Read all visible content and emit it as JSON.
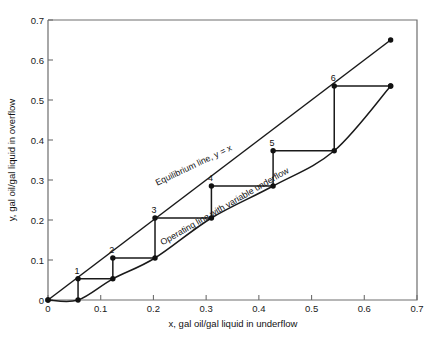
{
  "chart_data": {
    "type": "line",
    "title": "",
    "xlabel": "x, gal oil/gal liquid in underflow",
    "ylabel": "y, gal oil/gal liquid in overflow",
    "xlim": [
      0,
      0.7
    ],
    "ylim": [
      0,
      0.7
    ],
    "xticks": [
      "0",
      "0.1",
      "0.2",
      "0.3",
      "0.4",
      "0.5",
      "0.6",
      "0.7"
    ],
    "ytick_values": [
      0,
      0.1,
      0.2,
      0.3,
      0.4,
      0.5,
      0.6,
      0.7
    ],
    "yticks": [
      "0",
      "0.1",
      "0.2",
      "0.3",
      "0.4",
      "0.5",
      "0.6",
      "0.7"
    ],
    "xtick_values": [
      0,
      0.1,
      0.2,
      0.3,
      0.4,
      0.5,
      0.6,
      0.7
    ],
    "grid": false,
    "legend": "inline-curve-labels",
    "series": [
      {
        "name": "Equilibrium line, y = x",
        "style": "solid-straight",
        "points": [
          [
            0,
            0
          ],
          [
            0.65,
            0.65
          ]
        ],
        "endpoint_markers": [
          [
            0,
            0
          ],
          [
            0.65,
            0.65
          ]
        ]
      },
      {
        "name": "Operating line with variable underflow",
        "style": "solid-slightly-curved",
        "points": [
          [
            0,
            0
          ],
          [
            0.057,
            0.0
          ],
          [
            0.123,
            0.053
          ],
          [
            0.203,
            0.105
          ],
          [
            0.31,
            0.205
          ],
          [
            0.427,
            0.285
          ],
          [
            0.543,
            0.373
          ],
          [
            0.65,
            0.535
          ]
        ],
        "endpoint_markers": [
          [
            0,
            0
          ],
          [
            0.65,
            0.535
          ]
        ]
      }
    ],
    "staircase": {
      "description": "Stepwise construction between equilibrium line and operating line",
      "stage_points": [
        {
          "label": "1",
          "x": 0.057,
          "y": 0.053
        },
        {
          "label": "2",
          "x": 0.123,
          "y": 0.105
        },
        {
          "label": "3",
          "x": 0.203,
          "y": 0.205
        },
        {
          "label": "4",
          "x": 0.31,
          "y": 0.285
        },
        {
          "label": "5",
          "x": 0.427,
          "y": 0.373
        },
        {
          "label": "6",
          "x": 0.543,
          "y": 0.535
        }
      ],
      "operating_points": [
        {
          "x": 0.057,
          "y": 0.0
        },
        {
          "x": 0.123,
          "y": 0.053
        },
        {
          "x": 0.203,
          "y": 0.105
        },
        {
          "x": 0.31,
          "y": 0.205
        },
        {
          "x": 0.427,
          "y": 0.285
        },
        {
          "x": 0.543,
          "y": 0.373
        },
        {
          "x": 0.65,
          "y": 0.535
        }
      ]
    },
    "annotations": [
      {
        "text": "Equilibrium line, y = x",
        "x": 0.205,
        "y": 0.305,
        "rotation": -25.5
      },
      {
        "text": "Operating line with variable underflow",
        "x": 0.215,
        "y": 0.155,
        "rotation": -30.0
      }
    ]
  },
  "labels": {
    "eq_line_text": "Equilibrium line, y = x",
    "op_line_text": "Operating line with variable underflow",
    "step_1": "1",
    "step_2": "2",
    "step_3": "3",
    "step_4": "4",
    "step_5": "5",
    "step_6": "6",
    "x_title": "x, gal oil/gal liquid in underflow",
    "y_title": "y, gal oil/gal liquid in overflow",
    "xt0": "0",
    "xt1": "0.1",
    "xt2": "0.2",
    "xt3": "0.3",
    "xt4": "0.4",
    "xt5": "0.5",
    "xt6": "0.6",
    "xt7": "0.7",
    "yt0": "0",
    "yt1": "0.1",
    "yt2": "0.2",
    "yt3": "0.3",
    "yt4": "0.4",
    "yt5": "0.5",
    "yt6": "0.6",
    "yt7": "0.7"
  },
  "colors": {
    "line": "#1a1a1a",
    "frame": "#6e6e6e",
    "text": "#111111",
    "background": "#ffffff"
  }
}
